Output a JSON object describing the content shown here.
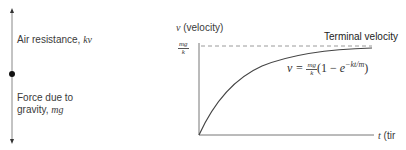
{
  "force_diagram": {
    "air_resistance_label": "Air resistance, ",
    "air_resistance_symbol": "kv",
    "gravity_label_line1": "Force due to",
    "gravity_label_line2": "gravity, ",
    "gravity_symbol": "mg"
  },
  "graph": {
    "y_axis_symbol": "v",
    "y_axis_label": " (velocity)",
    "y_tick_numerator": "mg",
    "y_tick_denominator": "k",
    "x_axis_symbol": "t",
    "x_axis_label": " (tir",
    "asymptote_label": "Terminal velocity",
    "equation": {
      "lhs": "v = ",
      "frac_num": "mg",
      "frac_den": "k",
      "paren_open": "(1 − ",
      "base": "e",
      "exponent": "−kt/m",
      "paren_close": ")"
    },
    "colors": {
      "axis": "#666666",
      "curve": "#444444",
      "asymptote": "#999999"
    }
  }
}
